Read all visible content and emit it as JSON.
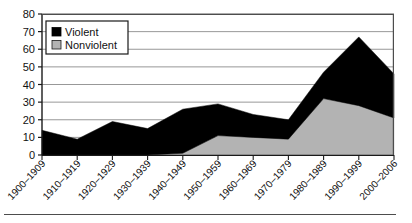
{
  "chart_data": {
    "type": "area",
    "stacked": true,
    "title": "",
    "subtitle": "",
    "xlabel": "",
    "ylabel": "",
    "ylim": [
      0,
      80
    ],
    "yticks": [
      0,
      10,
      20,
      30,
      40,
      50,
      60,
      70,
      80
    ],
    "ytick_labels": [
      "0",
      "10",
      "20",
      "30",
      "40",
      "50",
      "60",
      "70",
      "80"
    ],
    "grid": "horizontal",
    "legend_position": "upper-left",
    "categories": [
      "1900–1909",
      "1910–1919",
      "1920–1929",
      "1930–1939",
      "1940–1949",
      "1950–1959",
      "1960–1969",
      "1970–1979",
      "1980–1989",
      "1990–1999",
      "2000–2006"
    ],
    "series": [
      {
        "name": "Nonviolent",
        "color": "#b3b3b3",
        "values": [
          0,
          0,
          0,
          0,
          1,
          11,
          10,
          9,
          32,
          28,
          21
        ]
      },
      {
        "name": "Violent",
        "color": "#000000",
        "values": [
          14,
          9,
          19,
          15,
          25,
          18,
          13,
          11,
          15,
          39,
          25
        ]
      }
    ],
    "totals": [
      14,
      9,
      19,
      15,
      26,
      29,
      23,
      20,
      47,
      67,
      46
    ]
  },
  "legend": {
    "entries": [
      {
        "label": "Violent",
        "swatch": "black-square-icon",
        "color": "#000000"
      },
      {
        "label": "Nonviolent",
        "swatch": "gray-square-icon",
        "color": "#b3b3b3"
      }
    ]
  },
  "colors": {
    "violent": "#000000",
    "nonviolent": "#b3b3b3",
    "axis": "#1a1a1a",
    "grid": "#8c8c8c",
    "plot_background": "#ffffff",
    "rule": "#4d4d4d"
  }
}
